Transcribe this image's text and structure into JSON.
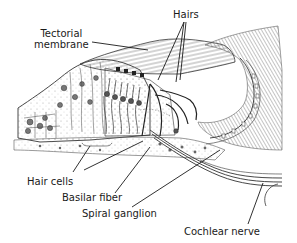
{
  "figure": {
    "type": "anatomical-illustration",
    "style": "pen-and-ink line drawing",
    "colors": {
      "ink": "#1a1a1a",
      "stipple": "#8a8a8a",
      "background": "#ffffff"
    }
  },
  "labels": {
    "tectorial_membrane_line1": "Tectorial",
    "tectorial_membrane_line2": "membrane",
    "hairs": "Hairs",
    "hair_cells": "Hair cells",
    "basilar_fiber": "Basilar fiber",
    "spiral_ganglion": "Spiral ganglion",
    "cochlear_nerve": "Cochlear nerve"
  }
}
